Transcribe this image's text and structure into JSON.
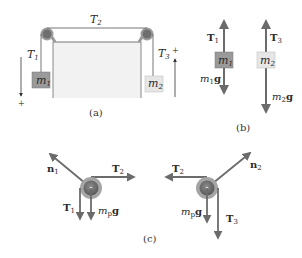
{
  "colors": {
    "vector": "#6b6b6b",
    "rope": "#555555",
    "table_fill": "#f2f2f2",
    "table_edge": "#777777",
    "block1": "#9a9a9a",
    "block2": "#e6e6e6",
    "pulley_outer": "#9d9d9d",
    "pulley_inner": "#6e6e6e"
  },
  "panel_a": {
    "caption": "(a)",
    "T1": {
      "sym": "T",
      "sub": "1"
    },
    "T2": {
      "sym": "T",
      "sub": "2"
    },
    "T3": {
      "sym": "T",
      "sub": "3"
    },
    "m1": {
      "sym": "m",
      "sub": "1"
    },
    "m2": {
      "sym": "m",
      "sub": "2"
    },
    "plus_left": "+",
    "plus_right": "+"
  },
  "panel_b": {
    "caption": "(b)",
    "T1": {
      "sym": "T",
      "sub": "1"
    },
    "T3": {
      "sym": "T",
      "sub": "3"
    },
    "m1": {
      "sym": "m",
      "sub": "1"
    },
    "m2": {
      "sym": "m",
      "sub": "2"
    },
    "w1": {
      "sym": "m",
      "sub": "1",
      "g": "g"
    },
    "w2": {
      "sym": "m",
      "sub": "2",
      "g": "g"
    }
  },
  "panel_c": {
    "caption": "(c)",
    "left": {
      "n": {
        "sym": "n",
        "sub": "1"
      },
      "T_horiz": {
        "sym": "T",
        "sub": "2"
      },
      "T_down": {
        "sym": "T",
        "sub": "1"
      },
      "w": {
        "sym": "m",
        "sub": "p",
        "g": "g"
      }
    },
    "right": {
      "n": {
        "sym": "n",
        "sub": "2"
      },
      "T_horiz": {
        "sym": "T",
        "sub": "2"
      },
      "T_down": {
        "sym": "T",
        "sub": "3"
      },
      "w": {
        "sym": "m",
        "sub": "p",
        "g": "g"
      }
    }
  }
}
